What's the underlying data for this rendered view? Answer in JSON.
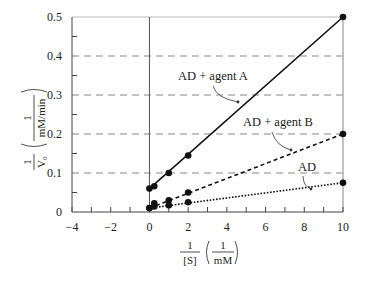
{
  "chart_data": {
    "type": "line",
    "title": "",
    "xlabel": "1/[S] (1/mM)",
    "ylabel": "1/V0 (1/(mM/min))",
    "xlim": [
      -4,
      10
    ],
    "ylim": [
      0,
      0.5
    ],
    "x_ticks": [
      -4,
      -2,
      0,
      2,
      4,
      6,
      8,
      10
    ],
    "x_tick_labels": [
      "−4",
      "−2",
      "0",
      "2",
      "4",
      "6",
      "8",
      "10"
    ],
    "y_ticks": [
      0,
      0.1,
      0.2,
      0.3,
      0.4,
      0.5
    ],
    "y_tick_labels": [
      "0",
      "0.1",
      "0.2",
      "0.3",
      "0.4",
      "0.5"
    ],
    "grid": "horizontal dashed at 0.1, 0.2, 0.3, 0.4",
    "series": [
      {
        "name": "AD + agent A",
        "style": "solid",
        "x": [
          0,
          0.25,
          1,
          2,
          10
        ],
        "values": [
          0.06,
          0.066,
          0.1,
          0.145,
          0.5
        ]
      },
      {
        "name": "AD + agent B",
        "style": "dashed",
        "x": [
          0,
          0.25,
          1,
          2,
          10
        ],
        "values": [
          0.01,
          0.022,
          0.03,
          0.05,
          0.2
        ]
      },
      {
        "name": "AD",
        "style": "dotted",
        "x": [
          0,
          0.25,
          1,
          2,
          10
        ],
        "values": [
          0.01,
          0.014,
          0.017,
          0.025,
          0.075
        ]
      }
    ],
    "annotations": [
      "AD + agent A",
      "AD + agent B",
      "AD"
    ]
  },
  "labels": {
    "x_num": "1",
    "x_den": "[S]",
    "x_unit_num": "1",
    "x_unit_den": "mM",
    "y_num": "1",
    "y_den": "V₀",
    "y_unit_num": "1",
    "y_unit_den": "mM/min"
  }
}
